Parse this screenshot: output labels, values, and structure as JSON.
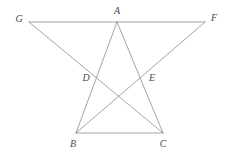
{
  "figure": {
    "background_color": "#ffffff",
    "stroke_color": "#8d8d8d",
    "label_color": "#4a4a4a",
    "stroke_width": 0.8,
    "canvas": {
      "width": 232,
      "height": 153
    },
    "points": [
      {
        "id": "G",
        "label": "G",
        "x": 29,
        "y": 22,
        "label_x": 19,
        "label_y": 19,
        "kind": "vertex"
      },
      {
        "id": "A",
        "label": "A",
        "x": 117,
        "y": 22,
        "label_x": 117,
        "label_y": 11,
        "kind": "vertex"
      },
      {
        "id": "F",
        "label": "F",
        "x": 205,
        "y": 22,
        "label_x": 214,
        "label_y": 18,
        "kind": "vertex"
      },
      {
        "id": "D",
        "label": "D",
        "x": 96,
        "y": 78,
        "label_x": 86,
        "label_y": 78,
        "kind": "intersection"
      },
      {
        "id": "E",
        "label": "E",
        "x": 145,
        "y": 78,
        "label_x": 152,
        "label_y": 78,
        "kind": "intersection"
      },
      {
        "id": "B",
        "label": "B",
        "x": 76,
        "y": 133,
        "label_x": 73,
        "label_y": 144,
        "kind": "vertex"
      },
      {
        "id": "C",
        "label": "C",
        "x": 163,
        "y": 133,
        "label_x": 163,
        "label_y": 144,
        "kind": "vertex"
      }
    ],
    "segments": [
      {
        "id": "seg-GA",
        "from": "G",
        "to": "A",
        "name": "segment-g-a"
      },
      {
        "id": "seg-AF",
        "from": "A",
        "to": "F",
        "name": "segment-a-f"
      },
      {
        "id": "seg-GC",
        "from": "G",
        "to": "C",
        "name": "segment-g-c"
      },
      {
        "id": "seg-FB",
        "from": "F",
        "to": "B",
        "name": "segment-f-b"
      },
      {
        "id": "seg-AB",
        "from": "A",
        "to": "B",
        "name": "segment-a-b"
      },
      {
        "id": "seg-AC",
        "from": "A",
        "to": "C",
        "name": "segment-a-c"
      },
      {
        "id": "seg-BC",
        "from": "B",
        "to": "C",
        "name": "segment-b-c"
      }
    ]
  }
}
